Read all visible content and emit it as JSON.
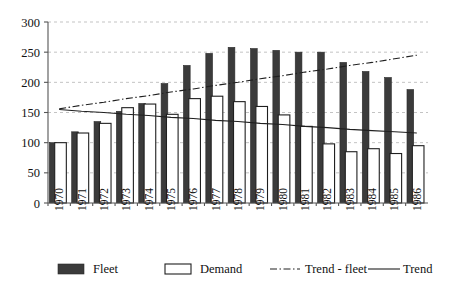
{
  "chart_data": {
    "type": "bar",
    "title": "",
    "subtitle": "",
    "xlabel": "",
    "ylabel": "",
    "ylim": [
      0,
      300
    ],
    "yticks": [
      0,
      50,
      100,
      150,
      200,
      250,
      300
    ],
    "grid": true,
    "legend_position": "bottom",
    "categories": [
      "1970",
      "1971",
      "1972",
      "1973",
      "1974",
      "1975",
      "1976",
      "1977",
      "1978",
      "1979",
      "1980",
      "1981",
      "1982",
      "1983",
      "1984",
      "1985",
      "1986"
    ],
    "series": [
      {
        "name": "Fleet",
        "style": "bar-filled",
        "color": "#3b3b3b",
        "values": [
          100,
          118,
          135,
          152,
          165,
          198,
          228,
          248,
          258,
          256,
          253,
          250,
          250,
          233,
          218,
          208,
          188
        ]
      },
      {
        "name": "Demand",
        "style": "bar-outline",
        "color": "#ffffff",
        "values": [
          100,
          116,
          132,
          158,
          164,
          147,
          173,
          177,
          168,
          160,
          146,
          127,
          98,
          85,
          90,
          82,
          95
        ]
      },
      {
        "name": "Trend - fleet",
        "style": "line-dashdot",
        "color": "#202020",
        "values": [
          156,
          162,
          167,
          173,
          178,
          184,
          189,
          195,
          200,
          206,
          211,
          217,
          222,
          228,
          233,
          239,
          245
        ]
      },
      {
        "name": "Trend",
        "style": "line-solid",
        "color": "#202020",
        "values": [
          155,
          152,
          150,
          147,
          145,
          142,
          140,
          137,
          135,
          132,
          130,
          127,
          125,
          122,
          120,
          118,
          116
        ]
      }
    ],
    "legend": [
      {
        "label": "Fleet",
        "marker": "filled-square"
      },
      {
        "label": "Demand",
        "marker": "open-square"
      },
      {
        "label": "Trend - fleet",
        "marker": "dashdot-line"
      },
      {
        "label": "Trend",
        "marker": "solid-line"
      }
    ]
  },
  "ticks": {
    "y": [
      "300",
      "250",
      "200",
      "150",
      "100",
      "50",
      "0"
    ]
  }
}
